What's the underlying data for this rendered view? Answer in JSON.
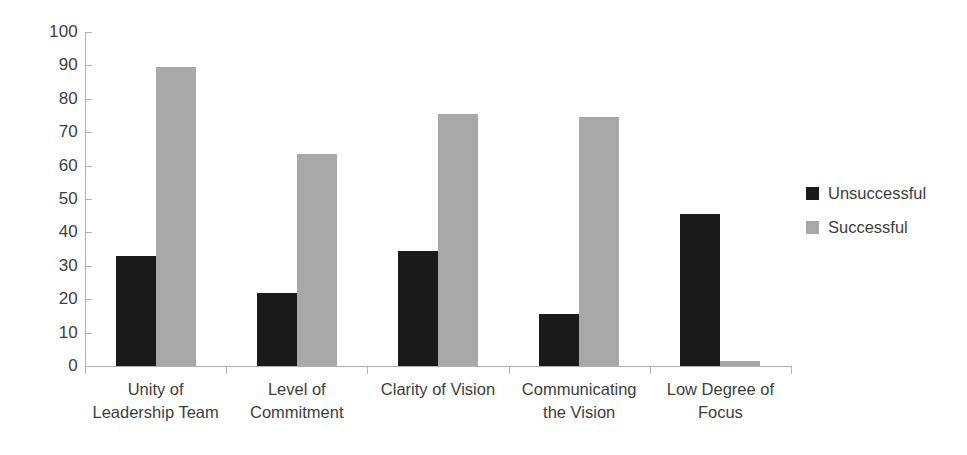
{
  "chart_data": {
    "type": "bar",
    "title": "",
    "subtitle": "",
    "xlabel": "",
    "ylabel": "",
    "ylim": [
      0,
      100
    ],
    "ytick_step": 10,
    "ytick_labels": [
      "100",
      "90",
      "80",
      "70",
      "60",
      "50",
      "40",
      "30",
      "20",
      "10",
      "0"
    ],
    "grid": false,
    "legend_position": "right",
    "categories": [
      "Unity of\nLeadership Team",
      "Level of\nCommitment",
      "Clarity of Vision",
      "Communicating\nthe Vision",
      "Low Degree of\nFocus"
    ],
    "category_lines": [
      [
        "Unity of",
        "Leadership Team"
      ],
      [
        "Level of",
        "Commitment"
      ],
      [
        "Clarity of Vision",
        ""
      ],
      [
        "Communicating",
        "the Vision"
      ],
      [
        "Low Degree of",
        "Focus"
      ]
    ],
    "series": [
      {
        "name": "Unsuccessful",
        "color": "#1a1a1a",
        "values": [
          33,
          22,
          34.5,
          15.5,
          45.5
        ]
      },
      {
        "name": "Successful",
        "color": "#a8a8a8",
        "values": [
          89.5,
          63.5,
          75.5,
          74.5,
          1.5
        ]
      }
    ]
  },
  "legend": {
    "items": [
      {
        "label": "Unsuccessful",
        "color": "#1a1a1a"
      },
      {
        "label": "Successful",
        "color": "#a8a8a8"
      }
    ]
  },
  "colors": {
    "unsuccessful": "#1a1a1a",
    "successful": "#a8a8a8",
    "axis": "#b0b0b0",
    "text": "#3d3d3d",
    "background": "#ffffff"
  }
}
